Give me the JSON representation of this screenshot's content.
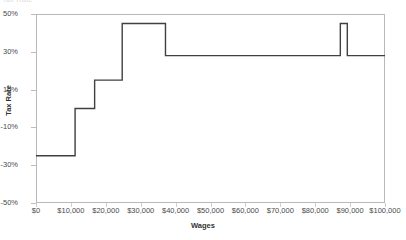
{
  "top_title": "Tax Rate",
  "axes": {
    "ylabel": "Tax Rate",
    "xlabel": "Wages",
    "yticks": [
      "50%",
      "30%",
      "10%",
      "-10%",
      "-30%",
      "-50%"
    ],
    "ytick_values": [
      50,
      30,
      10,
      -10,
      -30,
      -50
    ],
    "xticks": [
      "$0",
      "$10,000",
      "$20,000",
      "$30,000",
      "$40,000",
      "$50,000",
      "$60,000",
      "$70,000",
      "$80,000",
      "$90,000",
      "$100,000"
    ],
    "xtick_values": [
      0,
      10000,
      20000,
      30000,
      40000,
      50000,
      60000,
      70000,
      80000,
      90000,
      100000
    ]
  },
  "style": {
    "line_color": "#404040",
    "frame_color": "#b9b9b9",
    "background": "#ffffff"
  },
  "chart_data": {
    "type": "line",
    "title": "Tax Rate",
    "xlabel": "Wages",
    "ylabel": "Tax Rate",
    "xlim": [
      0,
      100000
    ],
    "ylim": [
      -50,
      50
    ],
    "grid": false,
    "legend": "none",
    "step_style": "post",
    "series": [
      {
        "name": "Effective marginal tax rate",
        "x": [
          0,
          11200,
          11200,
          16800,
          16800,
          24700,
          24700,
          37100,
          37100,
          87200,
          87200,
          89200,
          89200,
          100000
        ],
        "values": [
          -25,
          -25,
          0,
          0,
          15,
          15,
          45,
          45,
          28,
          28,
          45,
          45,
          28,
          28
        ]
      }
    ],
    "segments": [
      {
        "wage_from": 0,
        "wage_to": 11200,
        "rate": -25
      },
      {
        "wage_from": 11200,
        "wage_to": 16800,
        "rate": 0
      },
      {
        "wage_from": 16800,
        "wage_to": 24700,
        "rate": 15
      },
      {
        "wage_from": 24700,
        "wage_to": 37100,
        "rate": 45
      },
      {
        "wage_from": 37100,
        "wage_to": 87200,
        "rate": 28
      },
      {
        "wage_from": 87200,
        "wage_to": 89200,
        "rate": 45
      },
      {
        "wage_from": 89200,
        "wage_to": 100000,
        "rate": 28
      }
    ]
  }
}
